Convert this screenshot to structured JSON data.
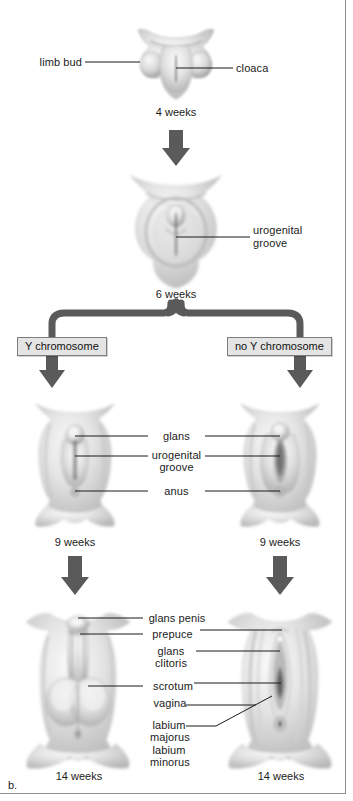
{
  "figure": {
    "panel_label": "b.",
    "title_implicit": "Development of external genitalia",
    "background_color": "#ffffff",
    "line_color": "#1b1b1b",
    "arrow_color": "#5a5a5a",
    "box_fill": "#e4e4e4",
    "box_border": "#7d7d7d",
    "frame_color": "#8f8f8f"
  },
  "stages": [
    {
      "id": "stage-4-weeks",
      "age": "4 weeks",
      "labels": [
        {
          "id": "limb-bud",
          "text": "limb bud",
          "side": "left"
        },
        {
          "id": "cloaca",
          "text": "cloaca",
          "side": "right"
        }
      ]
    },
    {
      "id": "stage-6-weeks",
      "age": "6 weeks",
      "labels": [
        {
          "id": "urogenital-groove",
          "text": "urogenital\ngroove",
          "line1": "urogenital",
          "line2": "groove",
          "side": "right"
        }
      ]
    },
    {
      "id": "stage-9-weeks-male",
      "age": "9 weeks",
      "branch": "Y chromosome"
    },
    {
      "id": "stage-9-weeks-female",
      "age": "9 weeks",
      "branch": "no Y chromosome"
    },
    {
      "id": "stage-14-weeks-male",
      "age": "14 weeks"
    },
    {
      "id": "stage-14-weeks-female",
      "age": "14 weeks"
    }
  ],
  "branch_boxes": {
    "left": "Y chromosome",
    "right": "no Y chromosome"
  },
  "shared_labels_9_weeks": [
    {
      "id": "glans",
      "text": "glans"
    },
    {
      "id": "urogenital-groove-9w",
      "line1": "urogenital",
      "line2": "groove"
    },
    {
      "id": "anus",
      "text": "anus"
    }
  ],
  "shared_labels_14_weeks": [
    {
      "id": "glans-penis",
      "text": "glans penis",
      "points_to": "left"
    },
    {
      "id": "prepuce",
      "text": "prepuce",
      "points_to": "both"
    },
    {
      "id": "glans-clitoris",
      "line1": "glans",
      "line2": "clitoris",
      "points_to": "right"
    },
    {
      "id": "scrotum",
      "text": "scrotum",
      "points_to": "left"
    },
    {
      "id": "vagina",
      "text": "vagina",
      "points_to": "right"
    },
    {
      "id": "labium-majorus",
      "line1": "labium",
      "line2": "majorus",
      "points_to": "right"
    },
    {
      "id": "labium-minorus",
      "line1": "labium",
      "line2": "minorus",
      "points_to": "right"
    }
  ]
}
